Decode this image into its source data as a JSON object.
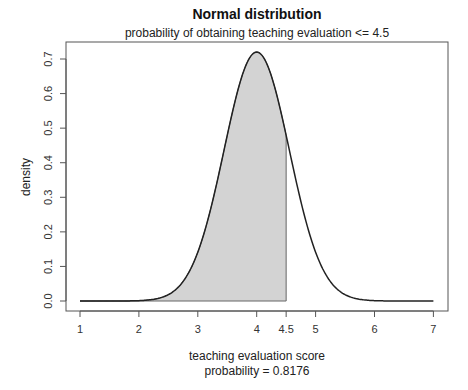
{
  "chart_data": {
    "type": "area",
    "title": "Normal distribution",
    "subtitle": "probability of obtaining teaching evaluation <= 4.5",
    "xlabel": "teaching evaluation score",
    "xlabel2": "probability = 0.8176",
    "ylabel": "density",
    "distribution": {
      "mean": 4.0,
      "sd": 0.554
    },
    "shade_upper": 4.5,
    "probability": 0.8176,
    "xlim": [
      1,
      7
    ],
    "ylim": [
      0,
      0.72
    ],
    "x_ticks": [
      1,
      2,
      3,
      4,
      4.5,
      5,
      6,
      7
    ],
    "x_tick_labels": [
      "1",
      "2",
      "3",
      "4",
      "4.5",
      "5",
      "6",
      "7"
    ],
    "y_ticks": [
      0.0,
      0.1,
      0.2,
      0.3,
      0.4,
      0.5,
      0.6,
      0.7
    ],
    "y_tick_labels": [
      "0.0",
      "0.1",
      "0.2",
      "0.3",
      "0.4",
      "0.5",
      "0.6",
      "0.7"
    ],
    "grid": false,
    "legend": null,
    "colors": {
      "fill": "#d3d3d3",
      "line": "#222222",
      "frame": "#555555"
    }
  }
}
